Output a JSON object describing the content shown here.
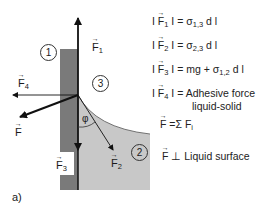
{
  "figure": {
    "panel_label": "a)",
    "regions": {
      "region_1": "1",
      "region_2": "2",
      "region_3": "3"
    },
    "angle_label": "φ",
    "vectors": {
      "F1": {
        "symbol": "F",
        "sub": "1"
      },
      "F2": {
        "symbol": "F",
        "sub": "2"
      },
      "F3": {
        "symbol": "F",
        "sub": "3"
      },
      "F4": {
        "symbol": "F",
        "sub": "4"
      },
      "F": {
        "symbol": "F",
        "sub": ""
      }
    },
    "colors": {
      "solid": "#7a7a7a",
      "liquid": "#c8c8c8",
      "line": "#111111",
      "background": "#ffffff"
    }
  },
  "equations": [
    {
      "lhs_open": "I",
      "vec": "F",
      "sub": "1",
      "lhs_close": "I =",
      "rhs": "σ",
      "rhs_sub": "1,3",
      "rhs_tail": " d l"
    },
    {
      "lhs_open": "I",
      "vec": "F",
      "sub": "2",
      "lhs_close": "I =",
      "rhs": "σ",
      "rhs_sub": "2,3",
      "rhs_tail": " d l"
    },
    {
      "lhs_open": "I",
      "vec": "F",
      "sub": "3",
      "lhs_close": "I = mg +",
      "rhs": " σ",
      "rhs_sub": "1,2",
      "rhs_tail": " d l"
    },
    {
      "lhs_open": "I",
      "vec": "F",
      "sub": "4",
      "lhs_close": "I =",
      "rhs": "Adhesive force",
      "rhs_sub": "",
      "rhs_tail": ""
    }
  ],
  "equation4_line2": "liquid-solid",
  "sum_equation": {
    "vec": "F",
    "eq": "=Σ",
    "term": "F",
    "term_sub": "i"
  },
  "perp_statement": {
    "vec": "F",
    "symbol": "⊥",
    "text": "Liquid surface"
  }
}
